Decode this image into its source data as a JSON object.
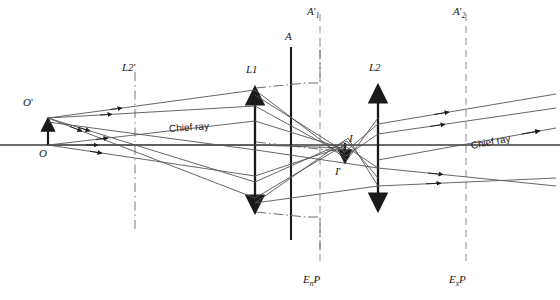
{
  "figure": {
    "stroke_color": "#1a1a1a",
    "axis_color": "#3a3a3a",
    "dash_color": "#6e6e6e",
    "background": "#ffffff"
  },
  "labels": {
    "object_tip": "O",
    "object_tip_prime": "'",
    "object_base": "O",
    "lens1": "L1",
    "lens2": "L2",
    "lens2_prime_base": "L2",
    "lens2_prime_mark": "'",
    "aperture_stop": "A",
    "image_tip": "I",
    "image_base": "I",
    "image_base_prime": "'",
    "aperture_image_1_base": "A",
    "aperture_image_1_sub": "1",
    "aperture_image_1_prime": "'",
    "aperture_image_2_base": "A",
    "aperture_image_2_sub": "2",
    "aperture_image_2_prime": "'",
    "entrance_pupil_base": "E",
    "entrance_pupil_sub": "n",
    "entrance_pupil_tail": "P",
    "exit_pupil_base": "E",
    "exit_pupil_sub": "x",
    "exit_pupil_tail": "P",
    "chief_ray_left": "Chief ray",
    "chief_ray_right": "Chief ray"
  },
  "geometry": {
    "axis_y": 145,
    "object_x": 48,
    "object_top_y": 117,
    "lens2_prime_x": 135,
    "lens1_x": 255,
    "aperture_x": 291,
    "image_x": 345,
    "lens2_x": 378,
    "enp_x": 320,
    "exp_x": 466,
    "lens1_top_y": 86,
    "lens1_bottom_y": 214,
    "lens2_top_y": 84,
    "lens2_bottom_y": 212,
    "aperture_top_y": 47,
    "aperture_bottom_y": 240,
    "image_bottom_y": 163,
    "canvas_width": 560,
    "canvas_height": 300
  }
}
